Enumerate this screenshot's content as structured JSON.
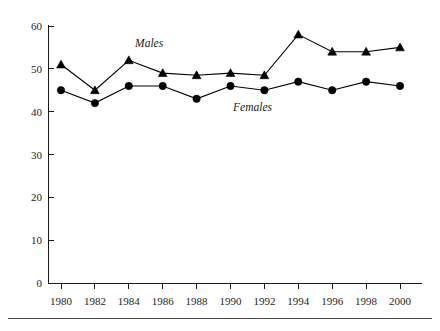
{
  "chart_data": {
    "type": "line",
    "title": "",
    "xlabel": "",
    "ylabel": "",
    "x": [
      1980,
      1982,
      1984,
      1986,
      1988,
      1990,
      1992,
      1994,
      1996,
      1998,
      2000
    ],
    "xtick_labels": [
      "1980",
      "1982",
      "1984",
      "1986",
      "1988",
      "1990",
      "1992",
      "1994",
      "1996",
      "1998",
      "2000"
    ],
    "ytick_labels": [
      "0",
      "10",
      "20",
      "30",
      "40",
      "50",
      "60"
    ],
    "yticks": [
      0,
      10,
      20,
      30,
      40,
      50,
      60
    ],
    "xlim": [
      1980,
      2000
    ],
    "ylim": [
      0,
      60
    ],
    "grid": false,
    "legend_position": "inline-annotations",
    "series": [
      {
        "name": "Males",
        "marker": "triangle",
        "color": "#000000",
        "values": [
          51,
          45,
          52,
          49,
          48.5,
          49,
          48.5,
          58,
          54,
          54,
          55
        ]
      },
      {
        "name": "Females",
        "marker": "circle",
        "color": "#000000",
        "values": [
          45,
          42,
          46,
          46,
          43,
          46,
          45,
          47,
          45,
          47,
          46
        ]
      }
    ],
    "annotations": [
      {
        "text": "Males",
        "x": 1985.2,
        "y": 55.0
      },
      {
        "text": "Females",
        "x": 1991.3,
        "y": 40.2
      }
    ]
  }
}
